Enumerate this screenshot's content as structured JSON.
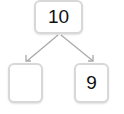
{
  "number_bond": {
    "whole": "10",
    "parts": [
      {
        "value": ""
      },
      {
        "value": "9"
      }
    ]
  },
  "colors": {
    "box_border": "#d8d8d8",
    "arrow": "#aaaaaa",
    "text": "#111111"
  }
}
